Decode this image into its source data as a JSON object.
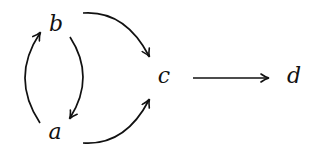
{
  "diagram": {
    "type": "commutative-diagram",
    "nodes": [
      {
        "id": "b",
        "label": "b",
        "x": 56,
        "y": 25
      },
      {
        "id": "a",
        "label": "a",
        "x": 55,
        "y": 133
      },
      {
        "id": "c",
        "label": "c",
        "x": 164,
        "y": 78
      },
      {
        "id": "d",
        "label": "d",
        "x": 294,
        "y": 77
      }
    ],
    "edges": [
      {
        "from": "b",
        "to": "c",
        "style": "curved"
      },
      {
        "from": "a",
        "to": "c",
        "style": "curved"
      },
      {
        "from": "a",
        "to": "b",
        "style": "curved-left"
      },
      {
        "from": "b",
        "to": "a",
        "style": "curved-right"
      },
      {
        "from": "c",
        "to": "d",
        "style": "straight"
      }
    ],
    "colors": {
      "stroke": "#111111",
      "background": "#ffffff"
    }
  }
}
